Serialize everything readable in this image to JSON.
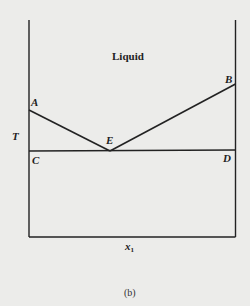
{
  "diagram": {
    "type": "eutectic phase diagram",
    "region_label": "Liquid",
    "y_axis_label": "T",
    "x_axis_label": "x",
    "x_axis_subscript": "1",
    "caption": "(b)",
    "points": {
      "A": "A",
      "B": "B",
      "C": "C",
      "D": "D",
      "E": "E"
    },
    "line_color": "#222222",
    "background": "#ececea"
  }
}
